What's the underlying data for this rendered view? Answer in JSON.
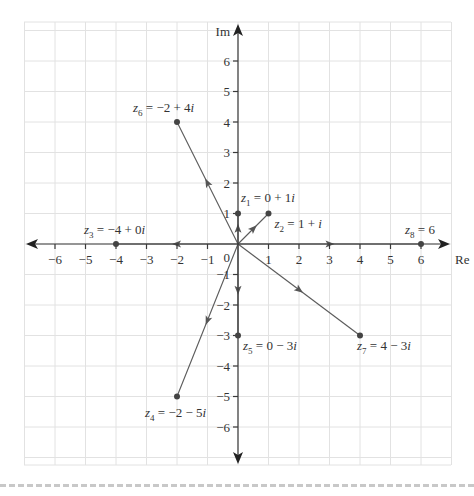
{
  "chart_data": {
    "type": "scatter",
    "title": "",
    "xlabel": "Re",
    "ylabel": "Im",
    "origin_label": "0",
    "xlim": [
      -7,
      7
    ],
    "ylim": [
      -7,
      7
    ],
    "grid": true,
    "x_ticks": [
      -6,
      -5,
      -4,
      -3,
      -2,
      -1,
      1,
      2,
      3,
      4,
      5,
      6
    ],
    "y_ticks": [
      -6,
      -5,
      -4,
      -3,
      -2,
      -1,
      1,
      2,
      3,
      4,
      5,
      6
    ],
    "points": [
      {
        "name": "z1",
        "re": 0,
        "im": 1,
        "label": "= 0 + 1i",
        "vector": true
      },
      {
        "name": "z2",
        "re": 1,
        "im": 1,
        "label": "= 1 + i",
        "vector": true
      },
      {
        "name": "z3",
        "re": -4,
        "im": 0,
        "label": "= −4 + 0i",
        "vector": true
      },
      {
        "name": "z4",
        "re": -2,
        "im": -5,
        "label": "= −2 − 5i",
        "vector": true
      },
      {
        "name": "z5",
        "re": 0,
        "im": -3,
        "label": "= 0 − 3i",
        "vector": true
      },
      {
        "name": "z6",
        "re": -2,
        "im": 4,
        "label": "= −2 + 4i",
        "vector": true
      },
      {
        "name": "z7",
        "re": 4,
        "im": -3,
        "label": "= 4 − 3i",
        "vector": true
      },
      {
        "name": "z8",
        "re": 6,
        "im": 0,
        "label": "= 6",
        "vector": true
      }
    ]
  },
  "labels": {
    "z1": {
      "var": "z",
      "sub": "1",
      "rest": " = 0 + 1",
      "i": "i"
    },
    "z2": {
      "var": "z",
      "sub": "2",
      "rest": " = 1 + ",
      "i": "i"
    },
    "z3": {
      "var": "z",
      "sub": "3",
      "rest": " = −4 + 0",
      "i": "i"
    },
    "z4": {
      "var": "z",
      "sub": "4",
      "rest": " = −2 − 5",
      "i": "i"
    },
    "z5": {
      "var": "z",
      "sub": "5",
      "rest": " = 0 − 3",
      "i": "i"
    },
    "z6": {
      "var": "z",
      "sub": "6",
      "rest": " = −2 + 4",
      "i": "i"
    },
    "z7": {
      "var": "z",
      "sub": "7",
      "rest": " = 4 − 3",
      "i": "i"
    },
    "z8": {
      "var": "z",
      "sub": "8",
      "rest": " = 6",
      "i": ""
    }
  },
  "axes": {
    "re": "Re",
    "im": "Im",
    "origin": "0"
  }
}
